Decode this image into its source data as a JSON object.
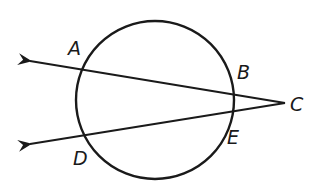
{
  "diagram": {
    "type": "geometry-circle-secants",
    "stroke_color": "#1a1a1a",
    "background": "#ffffff",
    "circle": {
      "cx": 155,
      "cy": 100,
      "r": 79
    },
    "external_point": {
      "label": "C",
      "x": 285,
      "y": 103
    },
    "secants": [
      {
        "name": "secant-CA",
        "from": "C",
        "through": [
          "B",
          "A"
        ],
        "arrow_tip": {
          "x": 26,
          "y": 60
        }
      },
      {
        "name": "secant-CD",
        "from": "C",
        "through": [
          "E",
          "D"
        ],
        "arrow_tip": {
          "x": 26,
          "y": 145
        }
      }
    ],
    "labels": {
      "A": "A",
      "B": "B",
      "C": "C",
      "D": "D",
      "E": "E"
    }
  }
}
